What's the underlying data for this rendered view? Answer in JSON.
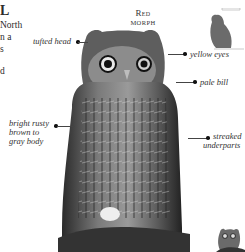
{
  "page": {
    "left_column": {
      "title_fragment": "L",
      "lines": [
        "North",
        "n a",
        "s",
        "",
        "d"
      ]
    },
    "morph_heading": {
      "line1": "Red",
      "line2": "morph"
    },
    "labels": {
      "tufted_head": "tufted head",
      "yellow_eyes": "yellow eyes",
      "pale_bill": "pale bill",
      "body_color_line1": "bright rusty",
      "body_color_line2": "brown to",
      "body_color_line3": "gray body",
      "streaked_line1": "streaked",
      "streaked_line2": "underparts"
    },
    "images": {
      "main_photo": "eastern-screech-owl-red-morph-photo",
      "flight_silhouette": "perched-owl-silhouette",
      "thumbnail": "gray-morph-owl-thumbnail"
    },
    "colors": {
      "text": "#2b2b2b",
      "silhouette": "#6b6b6b",
      "leader_line": "#444444"
    }
  }
}
